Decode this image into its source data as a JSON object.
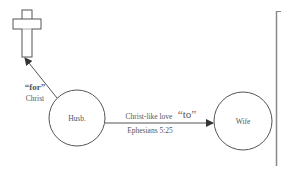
{
  "diagram": {
    "nodes": {
      "husband": {
        "label": "Husb."
      },
      "wife": {
        "label": "Wife"
      },
      "cross": {
        "icon": "cross-icon"
      }
    },
    "edges": {
      "to_cross": {
        "from": "husband",
        "to": "cross",
        "label_bold": "“for”",
        "label_sub": "Christ"
      },
      "to_wife": {
        "from": "husband",
        "to": "wife",
        "label_prefix": "Christ-like love",
        "label_quote": "“to”",
        "label_ref": "Ephesians 5:25"
      }
    },
    "colors": {
      "stroke": "#555555",
      "text": "#555555",
      "bracket": "#888888"
    }
  }
}
